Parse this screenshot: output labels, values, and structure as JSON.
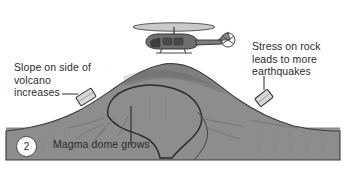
{
  "figure": {
    "step_number": "2",
    "background_color": "#ffffff",
    "ground_color": "#9a9a9a",
    "volcano_color": "#8d8d8d",
    "outline_color": "#2f2f2f",
    "text_color": "#2b2b2b"
  },
  "labels": {
    "left": "Slope on side of\nvolcano\nincreases",
    "right": "Stress on rock\nleads to more\nearthquakes",
    "bottom": "Magma dome grows"
  },
  "icons": {
    "helicopter": "helicopter-icon",
    "sensor_left": "tilt-sensor-icon",
    "sensor_right": "tilt-sensor-icon"
  }
}
